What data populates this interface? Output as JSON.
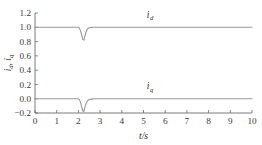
{
  "chart_data": {
    "type": "line",
    "title": "",
    "xlabel": "t/s",
    "ylabel": "i_d, i_q",
    "xlim": [
      0,
      10
    ],
    "ylim": [
      -0.2,
      1.2
    ],
    "xticks": [
      0,
      1,
      2,
      3,
      4,
      5,
      6,
      7,
      8,
      9,
      10
    ],
    "xticklabels": [
      "0",
      "1",
      "2",
      "3",
      "4",
      "5",
      "6",
      "7",
      "8",
      "9",
      "10"
    ],
    "yticks": [
      -0.2,
      0.0,
      0.2,
      0.4,
      0.6,
      0.8,
      1.0,
      1.2
    ],
    "yticklabels": [
      "-0.2",
      "0.0",
      "0.2",
      "0.4",
      "0.6",
      "0.8",
      "1.0",
      "1.2"
    ],
    "grid": false,
    "legend_position": "inline-annotation",
    "line_color": "#9a9a9a",
    "axis_color": "#6b6b6b",
    "series": [
      {
        "name": "i_d",
        "label_main": "i",
        "label_sub": "d",
        "annotation_x": 5.3,
        "annotation_y": 1.13,
        "steady_value": 1.0,
        "dip_time": 2.2,
        "dip_value": 0.82,
        "x": [
          0.0,
          0.5,
          1.0,
          1.5,
          1.9,
          2.0,
          2.05,
          2.1,
          2.15,
          2.2,
          2.25,
          2.3,
          2.35,
          2.4,
          2.45,
          2.5,
          2.6,
          2.7,
          2.8,
          3.0,
          3.5,
          4.0,
          5.0,
          6.0,
          7.0,
          8.0,
          9.0,
          10.0
        ],
        "y": [
          1.0,
          1.0,
          1.0,
          1.0,
          1.0,
          1.0,
          0.985,
          0.95,
          0.895,
          0.835,
          0.82,
          0.875,
          0.935,
          0.968,
          0.985,
          0.993,
          0.998,
          1.0,
          1.0,
          1.0,
          1.0,
          1.0,
          1.0,
          1.0,
          1.0,
          1.0,
          1.0,
          1.0
        ]
      },
      {
        "name": "i_q",
        "label_main": "i",
        "label_sub": "q",
        "annotation_x": 5.3,
        "annotation_y": 0.13,
        "steady_value": 0.0,
        "dip_time": 2.2,
        "dip_value": -0.18,
        "x": [
          0.0,
          0.5,
          1.0,
          1.5,
          1.9,
          2.0,
          2.05,
          2.1,
          2.15,
          2.2,
          2.25,
          2.3,
          2.35,
          2.4,
          2.45,
          2.5,
          2.6,
          2.7,
          2.8,
          3.0,
          3.5,
          4.0,
          5.0,
          6.0,
          7.0,
          8.0,
          9.0,
          10.0
        ],
        "y": [
          0.0,
          0.0,
          0.0,
          0.0,
          0.0,
          0.0,
          -0.015,
          -0.055,
          -0.115,
          -0.172,
          -0.18,
          -0.12,
          -0.068,
          -0.038,
          -0.021,
          -0.012,
          -0.005,
          -0.002,
          0.0,
          0.0,
          0.0,
          0.0,
          0.0,
          0.0,
          0.0,
          0.0,
          0.0,
          0.0
        ]
      }
    ]
  }
}
